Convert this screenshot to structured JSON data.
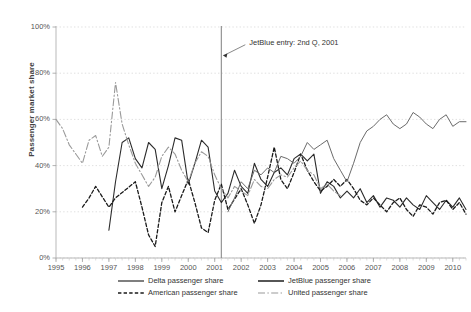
{
  "chart_data": {
    "type": "line",
    "title": "",
    "xlabel": "",
    "ylabel": "Passenger market share",
    "ylim": [
      0,
      100
    ],
    "xlim": [
      1995.0,
      2010.5
    ],
    "ytick_labels": [
      "0%",
      "20%",
      "40%",
      "60%",
      "80%",
      "100%"
    ],
    "ytick_values": [
      0,
      20,
      40,
      60,
      80,
      100
    ],
    "xtick_labels": [
      "1995",
      "1996",
      "1997",
      "1998",
      "1999",
      "2000",
      "2001",
      "2002",
      "2003",
      "2004",
      "2005",
      "2006",
      "2007",
      "2008",
      "2009",
      "2010"
    ],
    "xtick_values": [
      1995,
      1996,
      1997,
      1998,
      1999,
      2000,
      2001,
      2002,
      2003,
      2004,
      2005,
      2006,
      2007,
      2008,
      2009,
      2010
    ],
    "grid": "horizontal-dotted",
    "legend_position": "below-axis",
    "annotations": [
      {
        "text": "JetBlue entry: 2nd Q, 2001",
        "x": 2001.25,
        "arrow_to_x": 2001.25,
        "arrow_to_y": 88,
        "marker": "vertical-line"
      }
    ],
    "series": [
      {
        "name": "Delta passenger share",
        "color": "#2b2b2b",
        "style": "solid",
        "width": 1.1,
        "points": [
          [
            1997.0,
            12
          ],
          [
            1997.25,
            33
          ],
          [
            1997.5,
            50
          ],
          [
            1997.75,
            52
          ],
          [
            1998.0,
            43
          ],
          [
            1998.25,
            39
          ],
          [
            1998.5,
            50
          ],
          [
            1998.75,
            47
          ],
          [
            1999.0,
            30
          ],
          [
            1999.25,
            40
          ],
          [
            1999.5,
            52
          ],
          [
            1999.75,
            51
          ],
          [
            2000.0,
            32
          ],
          [
            2000.25,
            41
          ],
          [
            2000.5,
            51
          ],
          [
            2000.75,
            48
          ],
          [
            2001.0,
            29
          ],
          [
            2001.25,
            24
          ],
          [
            2001.5,
            28
          ],
          [
            2001.75,
            38
          ],
          [
            2002.0,
            31
          ],
          [
            2002.25,
            28
          ],
          [
            2002.5,
            41
          ],
          [
            2002.75,
            34
          ],
          [
            2003.0,
            31
          ],
          [
            2003.25,
            37
          ],
          [
            2003.5,
            39
          ],
          [
            2003.75,
            36
          ],
          [
            2004.0,
            43
          ],
          [
            2004.25,
            45
          ],
          [
            2004.5,
            42
          ],
          [
            2004.75,
            45
          ],
          [
            2005.0,
            28
          ],
          [
            2005.25,
            33
          ],
          [
            2005.5,
            31
          ],
          [
            2005.75,
            26
          ],
          [
            2006.0,
            29
          ],
          [
            2006.25,
            26
          ],
          [
            2006.5,
            30
          ],
          [
            2006.75,
            24
          ],
          [
            2007.0,
            27
          ],
          [
            2007.25,
            22
          ],
          [
            2007.5,
            26
          ],
          [
            2007.75,
            25
          ],
          [
            2008.0,
            22
          ],
          [
            2008.25,
            26
          ],
          [
            2008.5,
            23
          ],
          [
            2008.75,
            21
          ],
          [
            2009.0,
            27
          ],
          [
            2009.25,
            24
          ],
          [
            2009.5,
            21
          ],
          [
            2009.75,
            25
          ],
          [
            2010.0,
            22
          ],
          [
            2010.25,
            26
          ],
          [
            2010.5,
            21
          ]
        ]
      },
      {
        "name": "American passenger share",
        "color": "#1a1a1a",
        "style": "dashed",
        "width": 1.3,
        "points": [
          [
            1996.0,
            22
          ],
          [
            1996.25,
            26
          ],
          [
            1996.5,
            31
          ],
          [
            1997.0,
            22
          ],
          [
            1997.25,
            26
          ],
          [
            1998.0,
            33
          ],
          [
            1998.25,
            22
          ],
          [
            1998.5,
            10
          ],
          [
            1998.75,
            5
          ],
          [
            1999.0,
            24
          ],
          [
            1999.25,
            31
          ],
          [
            1999.5,
            20
          ],
          [
            2000.0,
            34
          ],
          [
            2000.25,
            24
          ],
          [
            2000.5,
            13
          ],
          [
            2000.75,
            11
          ],
          [
            2001.0,
            25
          ],
          [
            2001.25,
            32
          ],
          [
            2001.5,
            21
          ],
          [
            2002.0,
            30
          ],
          [
            2002.25,
            23
          ],
          [
            2002.5,
            15
          ],
          [
            2002.75,
            23
          ],
          [
            2003.0,
            35
          ],
          [
            2003.25,
            48
          ],
          [
            2003.5,
            34
          ],
          [
            2003.75,
            30
          ],
          [
            2004.0,
            37
          ],
          [
            2004.25,
            45
          ],
          [
            2004.5,
            38
          ],
          [
            2004.75,
            33
          ],
          [
            2005.0,
            29
          ],
          [
            2005.25,
            31
          ],
          [
            2005.5,
            34
          ],
          [
            2005.75,
            31
          ],
          [
            2006.0,
            34
          ],
          [
            2006.25,
            30
          ],
          [
            2006.5,
            25
          ],
          [
            2006.75,
            23
          ],
          [
            2007.0,
            26
          ],
          [
            2007.25,
            23
          ],
          [
            2007.5,
            20
          ],
          [
            2007.75,
            24
          ],
          [
            2008.0,
            26
          ],
          [
            2008.25,
            21
          ],
          [
            2008.5,
            18
          ],
          [
            2008.75,
            23
          ],
          [
            2009.0,
            22
          ],
          [
            2009.25,
            19
          ],
          [
            2009.5,
            24
          ],
          [
            2009.75,
            25
          ],
          [
            2010.0,
            21
          ],
          [
            2010.25,
            24
          ],
          [
            2010.5,
            19
          ]
        ]
      },
      {
        "name": "United passenger share",
        "color": "#9a9a9a",
        "style": "dash-dot",
        "width": 1.1,
        "points": [
          [
            1995.0,
            60
          ],
          [
            1995.25,
            56
          ],
          [
            1995.5,
            49
          ],
          [
            1995.75,
            45
          ],
          [
            1996.0,
            41
          ],
          [
            1996.25,
            51
          ],
          [
            1996.5,
            53
          ],
          [
            1996.75,
            44
          ],
          [
            1997.0,
            48
          ],
          [
            1997.25,
            76
          ],
          [
            1997.5,
            58
          ],
          [
            1997.75,
            49
          ],
          [
            1998.0,
            41
          ],
          [
            1998.25,
            36
          ],
          [
            1998.5,
            31
          ],
          [
            1998.75,
            35
          ],
          [
            1999.0,
            44
          ],
          [
            1999.25,
            48
          ],
          [
            1999.5,
            45
          ],
          [
            1999.75,
            38
          ],
          [
            2000.0,
            33
          ],
          [
            2000.25,
            41
          ],
          [
            2000.5,
            46
          ],
          [
            2000.75,
            44
          ],
          [
            2001.0,
            36
          ],
          [
            2001.25,
            30
          ],
          [
            2001.5,
            26
          ],
          [
            2001.75,
            31
          ],
          [
            2002.0,
            29
          ],
          [
            2002.25,
            27
          ],
          [
            2002.5,
            34
          ],
          [
            2002.75,
            31
          ],
          [
            2003.0,
            30
          ],
          [
            2003.25,
            34
          ],
          [
            2003.5,
            36
          ],
          [
            2003.75,
            35
          ],
          [
            2004.0,
            39
          ],
          [
            2004.25,
            42
          ],
          [
            2004.5,
            38
          ],
          [
            2004.75,
            36
          ],
          [
            2005.0,
            30
          ],
          [
            2005.25,
            32
          ],
          [
            2005.5,
            29
          ],
          [
            2005.75,
            27
          ]
        ]
      },
      {
        "name": "JetBlue passenger share",
        "color": "#6b6b6b",
        "style": "solid",
        "width": 1.0,
        "points": [
          [
            2001.5,
            20
          ],
          [
            2001.75,
            26
          ],
          [
            2002.0,
            33
          ],
          [
            2002.25,
            30
          ],
          [
            2002.5,
            38
          ],
          [
            2002.75,
            36
          ],
          [
            2003.0,
            39
          ],
          [
            2003.25,
            37
          ],
          [
            2003.5,
            44
          ],
          [
            2003.75,
            43
          ],
          [
            2004.0,
            41
          ],
          [
            2004.25,
            44
          ],
          [
            2004.5,
            50
          ],
          [
            2004.75,
            47
          ],
          [
            2005.0,
            49
          ],
          [
            2005.25,
            51
          ],
          [
            2005.5,
            43
          ],
          [
            2005.75,
            38
          ],
          [
            2006.0,
            33
          ],
          [
            2006.25,
            41
          ],
          [
            2006.5,
            50
          ],
          [
            2006.75,
            55
          ],
          [
            2007.0,
            57
          ],
          [
            2007.25,
            60
          ],
          [
            2007.5,
            62
          ],
          [
            2007.75,
            58
          ],
          [
            2008.0,
            56
          ],
          [
            2008.25,
            58
          ],
          [
            2008.5,
            63
          ],
          [
            2008.75,
            61
          ],
          [
            2009.0,
            58
          ],
          [
            2009.25,
            56
          ],
          [
            2009.5,
            60
          ],
          [
            2009.75,
            62
          ],
          [
            2010.0,
            57
          ],
          [
            2010.25,
            59
          ],
          [
            2010.5,
            59
          ]
        ]
      }
    ]
  },
  "legend": {
    "entries": [
      {
        "label": "Delta passenger share"
      },
      {
        "label": "JetBlue passenger share"
      },
      {
        "label": "American passenger share"
      },
      {
        "label": "United passenger share"
      }
    ]
  }
}
